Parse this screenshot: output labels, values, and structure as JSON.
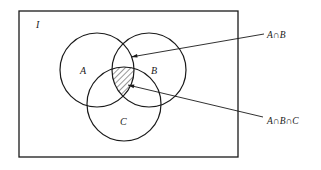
{
  "diagram": {
    "type": "venn",
    "universe_label": "I",
    "sets": [
      {
        "name": "A",
        "label": "A",
        "cx": 97,
        "cy": 70,
        "r": 37
      },
      {
        "name": "B",
        "label": "B",
        "cx": 149,
        "cy": 70,
        "r": 37
      },
      {
        "name": "C",
        "label": "C",
        "cx": 124,
        "cy": 104,
        "r": 37
      }
    ],
    "shaded_region": "A∩B∩C",
    "annotations": [
      {
        "label": "A∩B",
        "target": "intersection of A and B"
      },
      {
        "label": "A∩B∩C",
        "target": "intersection of A, B and C (shaded)"
      }
    ],
    "colors": {
      "stroke": "#1a1a1a",
      "background": "#ffffff"
    }
  }
}
